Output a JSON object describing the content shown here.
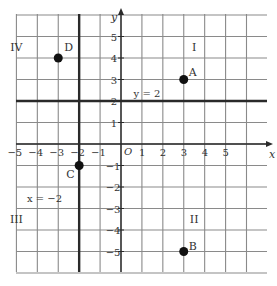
{
  "diagram": {
    "type": "coordinate-plane",
    "x_range": [
      -6,
      6
    ],
    "y_range": [
      -6,
      6
    ],
    "x_axis_label": "x",
    "y_axis_label": "y",
    "origin_label": "O",
    "x_ticks": [
      "-5",
      "-4",
      "-3",
      "-2",
      "-1",
      "1",
      "2",
      "3",
      "4",
      "5"
    ],
    "x_tick_values": [
      -5,
      -4,
      -3,
      -2,
      -1,
      1,
      2,
      3,
      4,
      5
    ],
    "y_ticks": [
      "5",
      "4",
      "3",
      "2",
      "1",
      "-1",
      "-2",
      "-3",
      "-4",
      "-5"
    ],
    "y_tick_values": [
      5,
      4,
      3,
      2,
      1,
      -1,
      -2,
      -3,
      -4,
      -5
    ],
    "lines": [
      {
        "label": "y = 2",
        "orientation": "horizontal",
        "value": 2
      },
      {
        "label": "x = −2",
        "orientation": "vertical",
        "value": -2
      }
    ],
    "points": [
      {
        "label": "A",
        "x": 3,
        "y": 3
      },
      {
        "label": "B",
        "x": 3,
        "y": -5
      },
      {
        "label": "C",
        "x": -2,
        "y": -1
      },
      {
        "label": "D",
        "x": -3,
        "y": 4
      }
    ],
    "quadrants": [
      {
        "label": "I",
        "x": 3.5,
        "y": 4.5
      },
      {
        "label": "II",
        "x": 3.5,
        "y": -3.5
      },
      {
        "label": "III",
        "x": -5,
        "y": -3.5
      },
      {
        "label": "IV",
        "x": -5,
        "y": 4.5
      }
    ],
    "colors": {
      "grid": "#8a8a8a",
      "bold": "#2a2a2a",
      "point": "#111111",
      "text": "#333333"
    }
  }
}
